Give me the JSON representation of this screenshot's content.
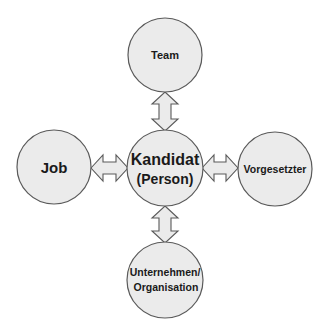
{
  "diagram": {
    "center": {
      "line1": "Kandidat",
      "line2": "(Person)"
    },
    "nodes": {
      "top": {
        "label": "Team"
      },
      "left": {
        "label": "Job"
      },
      "right": {
        "label": "Vorgesetzter"
      },
      "bottom": {
        "line1": "Unternehmen/",
        "line2": "Organisation"
      }
    },
    "connections": [
      {
        "from": "Kandidat (Person)",
        "to": "Team",
        "type": "bidirectional"
      },
      {
        "from": "Kandidat (Person)",
        "to": "Job",
        "type": "bidirectional"
      },
      {
        "from": "Kandidat (Person)",
        "to": "Vorgesetzter",
        "type": "bidirectional"
      },
      {
        "from": "Kandidat (Person)",
        "to": "Unternehmen/Organisation",
        "type": "bidirectional"
      }
    ],
    "colors": {
      "fill": "#ebebeb",
      "stroke": "#5a5a5a",
      "text": "#1a1a1a"
    }
  }
}
